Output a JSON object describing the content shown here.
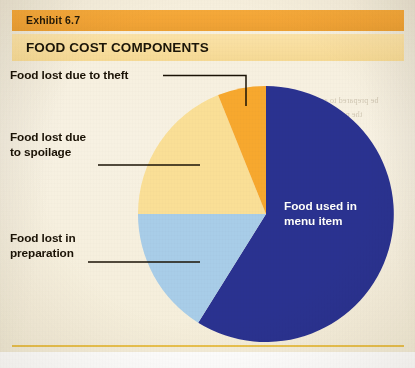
{
  "exhibit": {
    "number_label": "Exhibit 6.7",
    "title": "FOOD COST COMPONENTS"
  },
  "colors": {
    "bar_exhibit": "#f2a436",
    "bar_title": "#f8dd9c",
    "paper": "#f6efdd",
    "rule": "#e9c14e",
    "slice_blue": "#2b3190",
    "slice_lightblue": "#a8cde8",
    "slice_yellow": "#fadf96",
    "slice_orange": "#f7a82e",
    "leader_line": "#1a1205",
    "label_text": "#1a1205",
    "center_label_text": "#ffffff"
  },
  "callouts": {
    "theft": {
      "line1": "Food lost due to theft"
    },
    "spoilage": {
      "line1": "Food lost due",
      "line2": "to spoilage"
    },
    "preparation": {
      "line1": "Food lost in",
      "line2": "preparation"
    },
    "menu_item": {
      "line1": "Food used in",
      "line2": "menu item"
    }
  },
  "bleed_text": [
    {
      "x": 306,
      "y": 96,
      "t": "be prepared to accept"
    },
    {
      "x": 300,
      "y": 110,
      "t": "the portion cost of"
    },
    {
      "x": 312,
      "y": 124,
      "t": "an ingredient"
    },
    {
      "x": 300,
      "y": 166,
      "t": "in the recipe and"
    },
    {
      "x": 296,
      "y": 180,
      "t": "the standard"
    },
    {
      "x": 302,
      "y": 194,
      "t": "would be used"
    },
    {
      "x": 300,
      "y": 208,
      "t": "to determine"
    },
    {
      "x": 296,
      "y": 246,
      "t": "a recipe"
    },
    {
      "x": 300,
      "y": 260,
      "t": "and the cost"
    },
    {
      "x": 294,
      "y": 274,
      "t": "a percentage of"
    },
    {
      "x": 300,
      "y": 288,
      "t": "computed and the"
    }
  ],
  "chart_data": {
    "type": "pie",
    "title": "FOOD COST COMPONENTS",
    "legend_position": "callouts",
    "grid": false,
    "center": {
      "cx": 266,
      "cy": 214,
      "r": 128
    },
    "categories": [
      "Food used in menu item",
      "Food lost in preparation",
      "Food lost due to spoilage",
      "Food lost due to theft"
    ],
    "values": [
      59,
      14,
      21,
      6
    ],
    "unit": "percent",
    "slices": [
      {
        "name": "Food used in menu item",
        "value": 59,
        "color": "#2b3190",
        "start_angle_deg": 0,
        "end_angle_deg": 212,
        "label_inside": true
      },
      {
        "name": "Food lost in preparation",
        "value": 14,
        "color": "#a8cde8",
        "start_angle_deg": 212,
        "end_angle_deg": 270,
        "label_inside": false
      },
      {
        "name": "Food lost due to spoilage",
        "value": 21,
        "color": "#fadf96",
        "start_angle_deg": 270,
        "end_angle_deg": 338,
        "label_inside": false
      },
      {
        "name": "Food lost due to theft",
        "value": 6,
        "color": "#f7a82e",
        "start_angle_deg": 338,
        "end_angle_deg": 360,
        "label_inside": false
      }
    ]
  }
}
